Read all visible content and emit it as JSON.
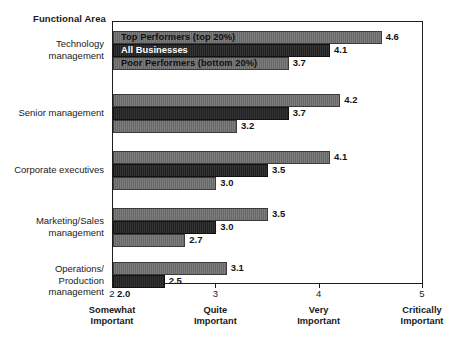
{
  "chart_data": {
    "type": "bar",
    "orientation": "horizontal",
    "title": "",
    "ylabel": "Functional Area",
    "xlabel": "",
    "xlim": [
      2,
      5
    ],
    "grid": false,
    "legend_position": "in-bars-top-group",
    "categories": [
      "Technology\nmanagement",
      "Senior management",
      "Corporate executives",
      "Marketing/Sales\nmanagement",
      "Operations/\nProduction\nmanagement"
    ],
    "series": [
      {
        "name": "Top Performers (top 20%)",
        "values": [
          4.6,
          4.2,
          4.1,
          3.5,
          3.1
        ]
      },
      {
        "name": "All Businesses",
        "values": [
          4.1,
          3.7,
          3.5,
          3.0,
          2.5
        ]
      },
      {
        "name": "Poor Performers (bottom 20%)",
        "values": [
          3.7,
          3.2,
          3.0,
          2.7,
          2.0
        ]
      }
    ],
    "value_labels": [
      [
        "4.6",
        "4.1",
        "3.7"
      ],
      [
        "4.2",
        "3.7",
        "3.2"
      ],
      [
        "4.1",
        "3.5",
        "3.0"
      ],
      [
        "3.5",
        "3.0",
        "2.7"
      ],
      [
        "3.1",
        "2.5",
        "2.0"
      ]
    ],
    "xticks": [
      {
        "value": 2,
        "number": "2",
        "caption": "Somewhat\nImportant"
      },
      {
        "value": 3,
        "number": "3",
        "caption": "Quite\nImportant"
      },
      {
        "value": 4,
        "number": "4",
        "caption": "Very\nImportant"
      },
      {
        "value": 5,
        "number": "5",
        "caption": "Critically\nImportant"
      }
    ],
    "colors": {
      "series_top_performers": "#6e6e6e",
      "series_all_businesses": "#252525",
      "series_poor_performers": "#6e6e6e",
      "axis": "#1d1d1d",
      "background": "#ffffff",
      "text": "#1a1a1a"
    }
  }
}
